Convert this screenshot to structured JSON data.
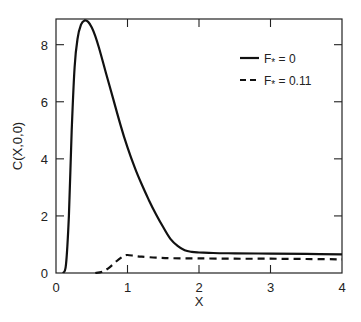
{
  "chart_data": {
    "type": "line",
    "title": "",
    "xlabel": "X",
    "ylabel": "C(X,0,0)",
    "xlim": [
      0,
      4
    ],
    "ylim": [
      0,
      8.9
    ],
    "xticks": [
      0,
      1,
      2,
      3,
      4
    ],
    "xtick_labels": [
      "0",
      "1",
      "2",
      "3",
      "4"
    ],
    "yticks": [
      0,
      2,
      4,
      6,
      8
    ],
    "ytick_labels": [
      "0",
      "2",
      "4",
      "6",
      "8"
    ],
    "grid": false,
    "legend_position": "upper right",
    "series": [
      {
        "name": "F* = 0",
        "legend_label": "F",
        "legend_sub": "*",
        "legend_value": "= 0",
        "style": "solid",
        "color": "#111111",
        "x": [
          0.1,
          0.14,
          0.18,
          0.22,
          0.26,
          0.3,
          0.35,
          0.4,
          0.45,
          0.5,
          0.55,
          0.6,
          0.7,
          0.8,
          0.9,
          1.0,
          1.1,
          1.2,
          1.3,
          1.4,
          1.5,
          1.6,
          1.7,
          1.8,
          1.9,
          2.0,
          2.2,
          2.5,
          3.0,
          3.5,
          4.0
        ],
        "y": [
          0.0,
          0.3,
          2.0,
          5.0,
          7.2,
          8.2,
          8.7,
          8.85,
          8.8,
          8.6,
          8.3,
          7.9,
          7.0,
          6.1,
          5.2,
          4.4,
          3.7,
          3.1,
          2.55,
          2.05,
          1.6,
          1.2,
          0.95,
          0.8,
          0.74,
          0.72,
          0.7,
          0.69,
          0.68,
          0.67,
          0.65
        ]
      },
      {
        "name": "F* = 0.11",
        "legend_label": "F",
        "legend_sub": "*",
        "legend_value": "= 0.11",
        "style": "dashed",
        "color": "#111111",
        "x": [
          0.55,
          0.65,
          0.75,
          0.85,
          0.95,
          1.0,
          1.1,
          1.2,
          1.4,
          1.6,
          2.0,
          2.5,
          3.0,
          3.5,
          4.0
        ],
        "y": [
          0.0,
          0.05,
          0.2,
          0.42,
          0.6,
          0.63,
          0.6,
          0.57,
          0.54,
          0.52,
          0.51,
          0.5,
          0.5,
          0.49,
          0.48
        ]
      }
    ]
  }
}
